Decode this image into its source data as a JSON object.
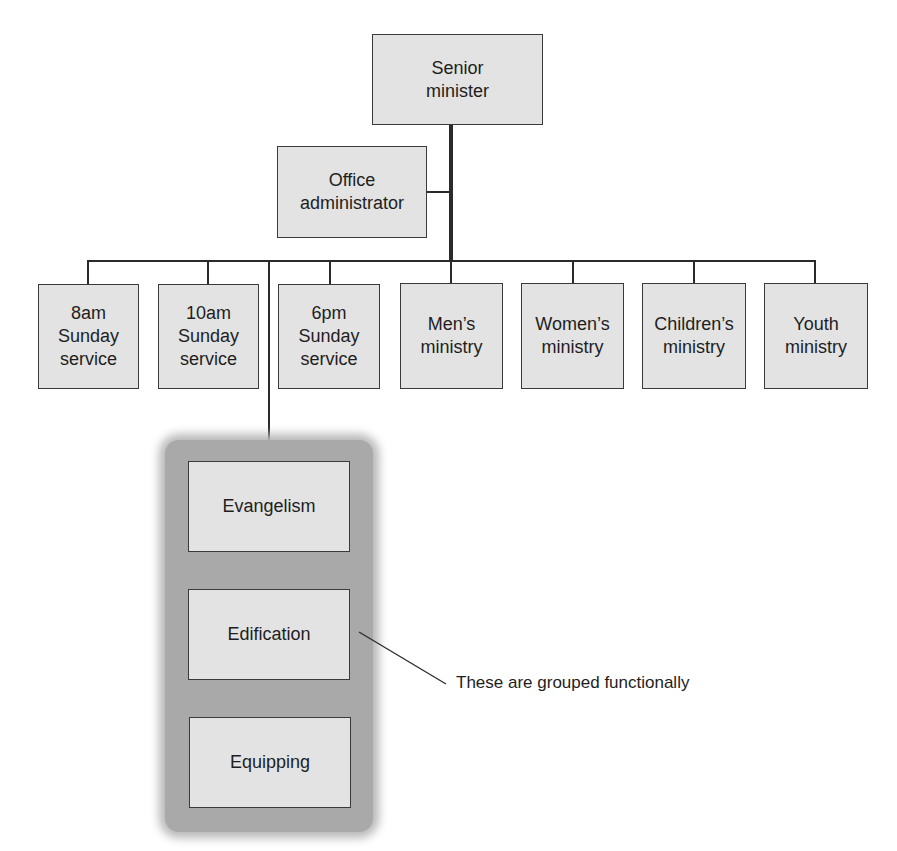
{
  "diagram": {
    "type": "org-chart",
    "root": {
      "label": "Senior\nminister"
    },
    "staff": {
      "label": "Office\nadministrator"
    },
    "departments": [
      {
        "label": "8am\nSunday\nservice"
      },
      {
        "label": "10am\nSunday\nservice"
      },
      {
        "label": "6pm\nSunday\nservice"
      },
      {
        "label": "Men’s\nministry"
      },
      {
        "label": "Women’s\nministry"
      },
      {
        "label": "Children’s\nministry"
      },
      {
        "label": "Youth\nministry"
      }
    ],
    "functional_group": {
      "items": [
        {
          "label": "Evangelism"
        },
        {
          "label": "Edification"
        },
        {
          "label": "Equipping"
        }
      ],
      "annotation": "These are grouped functionally"
    },
    "colors": {
      "box_fill": "#e3e3e3",
      "box_border": "#3a3a3a",
      "group_fill": "#a9a9a9",
      "line": "#2a2a2a"
    }
  }
}
